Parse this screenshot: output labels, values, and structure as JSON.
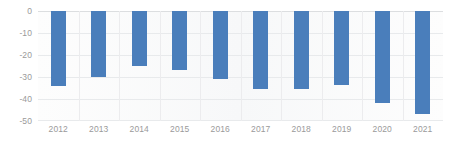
{
  "chart_data": {
    "type": "bar",
    "title": "",
    "subtitle": "",
    "xlabel": "",
    "ylabel": "",
    "categories": [
      "2012",
      "2013",
      "2014",
      "2015",
      "2016",
      "2017",
      "2018",
      "2019",
      "2020",
      "2021"
    ],
    "values": [
      -34,
      -30,
      -25,
      -27,
      -31,
      -35.5,
      -35.5,
      -33.5,
      -42,
      -47
    ],
    "ylim": [
      -50,
      0
    ],
    "xlim": [
      null,
      null
    ],
    "y_ticks": [
      0,
      -10,
      -20,
      -30,
      -40,
      -50
    ],
    "y_tick_labels": [
      "0",
      "-10",
      "-20",
      "-30",
      "-40",
      "-50"
    ],
    "grid": true,
    "grid_axis": "both",
    "legend": false,
    "legend_position": "none",
    "series": [
      {
        "name": "",
        "color": "#4a7ebb",
        "values": [
          -34,
          -30,
          -25,
          -27,
          -31,
          -35.5,
          -35.5,
          -33.5,
          -42,
          -47
        ]
      }
    ],
    "annotations": []
  },
  "style": {
    "bar_color": "#4a7ebb",
    "plot_background": "#fbfbfb",
    "gridline_color": "#e8eaec",
    "zero_line_color": "#dcdee0",
    "tick_label_color": "#9a9a9a",
    "page_background": "#ffffff"
  }
}
